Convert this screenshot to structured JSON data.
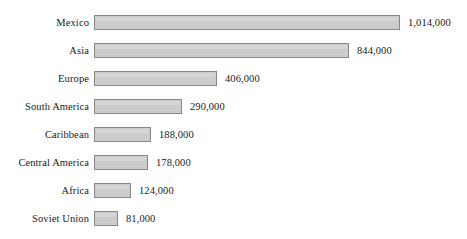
{
  "chart_data": {
    "type": "bar",
    "orientation": "horizontal",
    "title": "",
    "subtitle": "",
    "xlabel": "",
    "ylabel": "",
    "grid": false,
    "legend": null,
    "axis_visible": false,
    "xlim": [
      0,
      1014000
    ],
    "categories": [
      "Mexico",
      "Asia",
      "Europe",
      "South America",
      "Caribbean",
      "Central America",
      "Africa",
      "Soviet Union"
    ],
    "values": [
      1014000,
      844000,
      406000,
      290000,
      188000,
      178000,
      124000,
      81000
    ],
    "value_labels": [
      "1,014,000",
      "844,000",
      "406,000",
      "290,000",
      "188,000",
      "178,000",
      "124,000",
      "81,000"
    ],
    "colors": {
      "bar_fill": "#cccccc",
      "bar_border": "#878787",
      "text": "#1a1a1a",
      "background": "#ffffff"
    }
  },
  "layout": {
    "bar_origin_x": 94,
    "px_per_unit": 0.000302,
    "row_pitch": 28,
    "first_row_top": 15,
    "bar_height": 15,
    "label_gap": 8
  }
}
